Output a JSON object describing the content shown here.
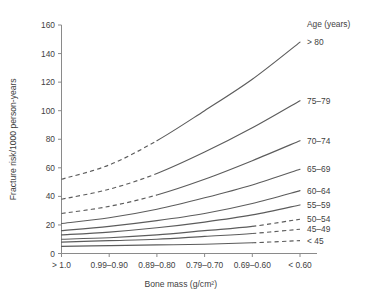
{
  "chart_data": {
    "type": "line",
    "title": "",
    "xlabel": "Bone mass (g/cm²)",
    "ylabel": "Fracture risk/1000 person-years",
    "categories": [
      "> 1.0",
      "0.99–0.90",
      "0.89–0.80",
      "0.79–0.70",
      "0.69–0.60",
      "< 0.60"
    ],
    "xtick_labels": [
      "> 1.0",
      "0.99–0.90",
      "0.89–0.80",
      "0.79–0.70",
      "0.69–0.60",
      "< 0.60"
    ],
    "ytick_labels": [
      "0",
      "20",
      "40",
      "60",
      "80",
      "100",
      "120",
      "140",
      "160"
    ],
    "ytick_values": [
      0,
      20,
      40,
      60,
      80,
      100,
      120,
      140,
      160
    ],
    "ylim": [
      0,
      160
    ],
    "grid": false,
    "legend_position": "right-inline",
    "legend_title": "Age (years)",
    "series": [
      {
        "name": "> 80",
        "label": "> 80",
        "values": [
          52,
          62,
          79,
          100,
          122,
          148
        ],
        "dashed_segment": "left",
        "dash_until_index": 2
      },
      {
        "name": "75–79",
        "label": "75–79",
        "values": [
          38,
          45,
          56,
          71,
          88,
          107
        ],
        "dashed_segment": "left",
        "dash_until_index": 2
      },
      {
        "name": "70–74",
        "label": "70–74",
        "values": [
          28,
          33,
          41,
          52,
          65,
          79
        ],
        "dashed_segment": "left",
        "dash_until_index": 2
      },
      {
        "name": "65–69",
        "label": "65–69",
        "values": [
          21,
          25,
          31,
          39,
          48,
          59
        ],
        "dashed_segment": "none",
        "dash_until_index": 0
      },
      {
        "name": "60–64",
        "label": "60–64",
        "values": [
          16,
          19,
          23,
          28,
          35,
          44
        ],
        "dashed_segment": "none",
        "dash_until_index": 0
      },
      {
        "name": "55–59",
        "label": "55–59",
        "values": [
          13,
          15,
          18,
          22,
          27,
          34
        ],
        "dashed_segment": "none",
        "dash_until_index": 0
      },
      {
        "name": "50–54",
        "label": "50–54",
        "values": [
          10,
          11,
          13,
          16,
          19,
          24
        ],
        "dashed_segment": "right",
        "dash_from_index": 4
      },
      {
        "name": "45–49",
        "label": "45–49",
        "values": [
          8,
          9,
          10,
          12,
          14,
          17
        ],
        "dashed_segment": "right",
        "dash_from_index": 4
      },
      {
        "name": "< 45",
        "label": "< 45",
        "values": [
          5,
          5.5,
          6,
          6.5,
          7.5,
          9
        ],
        "dashed_segment": "right",
        "dash_from_index": 4
      }
    ]
  }
}
